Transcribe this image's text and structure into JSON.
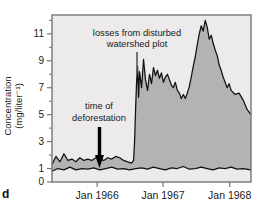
{
  "figure": {
    "panel_label": "d",
    "axis": {
      "ylabel_line1": "Concentration",
      "ylabel_line2": "(mg/liter⁻¹)",
      "y_ticks": [
        "0",
        "1",
        "3",
        "5",
        "7",
        "9",
        "11"
      ],
      "x_ticks": [
        "Jan 1966",
        "Jan 1967",
        "Jan 1968"
      ]
    },
    "annotations": {
      "disturbed_line1": "losses from disturbed",
      "disturbed_line2": "watershed plot",
      "deforestation_line1": "time of",
      "deforestation_line2": "deforestation"
    },
    "colors": {
      "plot_background": "#eceaea",
      "fill_disturbed": "#b4b2b2",
      "curve": "#111111",
      "frame": "#777777",
      "text": "#1a1a1a"
    }
  },
  "chart_data": {
    "type": "area",
    "title": "",
    "xlabel": "",
    "ylabel": "Concentration (mg/liter⁻¹)",
    "xlim": [
      "Jul 1965",
      "Jul 1968"
    ],
    "ylim": [
      0,
      12.4
    ],
    "y_tick_values": [
      0,
      1,
      3,
      5,
      7,
      9,
      11
    ],
    "x_tick_labels": [
      "Jan 1966",
      "Jan 1967",
      "Jan 1968"
    ],
    "grid": false,
    "legend": "none",
    "annotations": [
      {
        "text": "losses from disturbed watershed plot",
        "x": "Nov 1966",
        "y": 9.6,
        "pointer": "line-down"
      },
      {
        "text": "time of deforestation",
        "x": "Jan 1966",
        "y": 4.6,
        "pointer": "arrow-down"
      }
    ],
    "series": [
      {
        "name": "disturbed watershed plot",
        "fill": "#b4b2b2",
        "x": [
          0.0,
          0.02,
          0.04,
          0.06,
          0.08,
          0.1,
          0.12,
          0.14,
          0.16,
          0.18,
          0.2,
          0.22,
          0.24,
          0.26,
          0.28,
          0.3,
          0.32,
          0.34,
          0.36,
          0.38,
          0.4,
          0.41,
          0.415,
          0.42,
          0.425,
          0.43,
          0.435,
          0.44,
          0.45,
          0.46,
          0.47,
          0.48,
          0.49,
          0.5,
          0.51,
          0.52,
          0.53,
          0.54,
          0.55,
          0.56,
          0.57,
          0.58,
          0.59,
          0.6,
          0.61,
          0.62,
          0.63,
          0.64,
          0.65,
          0.66,
          0.67,
          0.68,
          0.69,
          0.7,
          0.71,
          0.72,
          0.73,
          0.74,
          0.75,
          0.76,
          0.77,
          0.78,
          0.79,
          0.8,
          0.81,
          0.82,
          0.83,
          0.84,
          0.85,
          0.86,
          0.87,
          0.88,
          0.89,
          0.9,
          0.92,
          0.94,
          0.96,
          0.98,
          1.0
        ],
        "values": [
          1.3,
          1.9,
          1.5,
          2.1,
          1.6,
          1.7,
          1.5,
          1.8,
          1.6,
          1.7,
          1.6,
          1.8,
          1.7,
          1.6,
          1.8,
          1.7,
          1.9,
          1.8,
          1.6,
          1.5,
          1.4,
          1.6,
          3.0,
          5.4,
          7.4,
          8.6,
          6.3,
          8.2,
          7.0,
          9.1,
          7.6,
          6.8,
          8.0,
          7.3,
          8.5,
          7.9,
          8.3,
          7.7,
          8.1,
          7.4,
          7.8,
          8.0,
          7.6,
          7.2,
          7.0,
          7.4,
          6.8,
          6.6,
          6.2,
          6.5,
          6.2,
          6.6,
          7.1,
          7.8,
          8.6,
          9.3,
          10.2,
          11.0,
          11.6,
          11.2,
          12.0,
          11.5,
          10.6,
          10.9,
          10.3,
          9.8,
          9.4,
          8.7,
          8.3,
          7.8,
          7.4,
          7.0,
          7.3,
          6.8,
          6.5,
          6.6,
          6.1,
          5.4,
          5.0
        ]
      },
      {
        "name": "reference watershed",
        "fill": "none",
        "x": [
          0.0,
          0.03,
          0.06,
          0.09,
          0.12,
          0.15,
          0.18,
          0.21,
          0.24,
          0.27,
          0.3,
          0.33,
          0.36,
          0.39,
          0.42,
          0.45,
          0.48,
          0.51,
          0.54,
          0.57,
          0.6,
          0.63,
          0.66,
          0.69,
          0.72,
          0.75,
          0.78,
          0.81,
          0.84,
          0.87,
          0.9,
          0.93,
          0.96,
          1.0
        ],
        "values": [
          0.8,
          1.0,
          0.9,
          1.1,
          0.9,
          1.0,
          0.95,
          1.05,
          0.9,
          1.0,
          1.1,
          0.95,
          1.0,
          0.9,
          1.0,
          1.05,
          0.95,
          1.1,
          1.0,
          0.9,
          1.05,
          1.0,
          1.15,
          0.95,
          1.0,
          1.1,
          1.0,
          0.9,
          1.05,
          1.0,
          1.1,
          0.95,
          1.0,
          0.9
        ]
      }
    ]
  }
}
